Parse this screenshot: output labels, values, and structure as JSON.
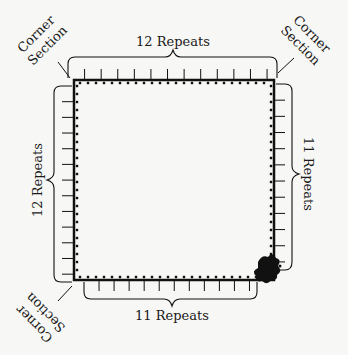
{
  "diagram": {
    "top_label": "12 Repeats",
    "left_label": "12 Repeats",
    "right_label": "11 Repeats",
    "bottom_label": "11 Repeats",
    "corner_top_left": {
      "line1": "Corner",
      "line2": "Section"
    },
    "corner_top_right": {
      "line1": "Corner",
      "line2": "Section"
    },
    "corner_bottom_left": {
      "line1": "Corner",
      "line2": "Section"
    },
    "top_repeats": 12,
    "left_repeats": 12,
    "right_repeats": 11,
    "bottom_repeats": 11,
    "colors": {
      "ink": "#111111",
      "background": "#f7f7f5"
    }
  }
}
